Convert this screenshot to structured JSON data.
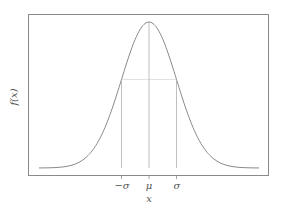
{
  "chart_data": {
    "type": "line",
    "title": "",
    "xlabel": "x",
    "ylabel": "f(x)",
    "x_ticks": [
      "−σ",
      "μ",
      "σ"
    ],
    "x_tick_values": [
      -1,
      0,
      1
    ],
    "xlim": [
      -4,
      4
    ],
    "ylim": [
      0,
      0.42
    ],
    "grid": false,
    "legend": null,
    "series": [
      {
        "name": "normal pdf",
        "mu": 0,
        "sigma": 1,
        "x": [
          -4,
          -3,
          -2,
          -1,
          0,
          1,
          2,
          3,
          4
        ],
        "values": [
          0.0001,
          0.0044,
          0.054,
          0.242,
          0.399,
          0.242,
          0.054,
          0.0044,
          0.0001
        ]
      }
    ],
    "annotations": [
      {
        "type": "vline",
        "x": -1,
        "style": "solid",
        "to": "curve"
      },
      {
        "type": "vline",
        "x": 0,
        "style": "solid",
        "to": "curve"
      },
      {
        "type": "vline",
        "x": 1,
        "style": "solid",
        "to": "curve"
      },
      {
        "type": "hline",
        "y": 0.242,
        "from": -1,
        "to": 1,
        "style": "dotted"
      }
    ],
    "colors": {
      "curve": "#8a8a8a",
      "frame": "#8a8a8a",
      "guides": "#b0b0b0"
    }
  },
  "labels": {
    "xlabel": "x",
    "ylabel": "f(x)",
    "tick_neg_sigma": "−σ",
    "tick_mu": "μ",
    "tick_sigma": "σ"
  }
}
